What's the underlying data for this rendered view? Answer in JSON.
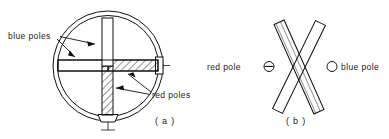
{
  "figure": {
    "background_color": "#ffffff",
    "line_color": "#111111"
  },
  "panel_a": {
    "caption": "( a )",
    "labels": {
      "blue_poles": "blue poles",
      "red_poles": "red poles"
    },
    "description": "Circular housing containing a cross of two magnet bars; unhatched arms are blue poles, hatched arms are red poles",
    "geometry": {
      "outer_circle_r": 55,
      "inner_circle_r": 51,
      "center_x": 108,
      "center_y": 66
    },
    "arrow_count_blue": 2,
    "arrow_count_red": 2
  },
  "panel_b": {
    "caption": "( b )",
    "legend": [
      {
        "symbol": "circle-with-bar",
        "label": "red pole",
        "symbol_char": "⊖",
        "position": "left"
      },
      {
        "symbol": "open-circle",
        "label": "blue pole",
        "symbol_char": "○",
        "position": "right"
      }
    ],
    "description": "Two crossed magnet bars forming an X; the hatched bar overlays the plain bar"
  }
}
